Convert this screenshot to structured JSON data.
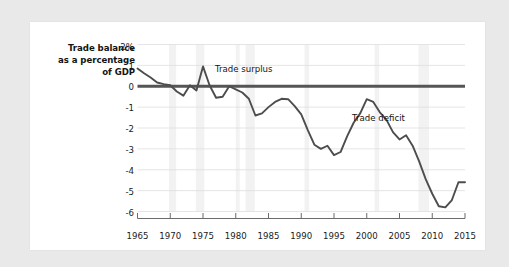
{
  "figure": {
    "background_color": "#e9e9e9",
    "card_color": "#ffffff"
  },
  "chart_data": {
    "type": "line",
    "title": "",
    "subtitle": "",
    "xlabel": "",
    "ylabel": "Trade balance as a percentage of GDP",
    "ylabel_lines": [
      "Trade balance",
      "as a percentage",
      "of GDP"
    ],
    "grid": true,
    "legend_position": "none",
    "xlim": [
      1965,
      2015
    ],
    "ylim": [
      -6,
      2
    ],
    "xticks": [
      1965,
      1970,
      1975,
      1980,
      1985,
      1990,
      1995,
      2000,
      2005,
      2010,
      2015
    ],
    "xtick_labels": [
      "1965",
      "1970",
      "1975",
      "1980",
      "1985",
      "1990",
      "1995",
      "2000",
      "2005",
      "2010",
      "2015"
    ],
    "yticks": [
      2,
      1,
      0,
      -1,
      -2,
      -3,
      -4,
      -5,
      -6
    ],
    "ytick_labels": [
      "2%",
      "1",
      "0",
      "-1",
      "-2",
      "-3",
      "-4",
      "-5",
      "-6"
    ],
    "series_name": "Trade balance as a percentage of GDP",
    "line_color": "#4d4d4d",
    "line_width": 1.9,
    "zero_line_color": "#555555",
    "zero_line_width": 3.0,
    "recession_band_color": "#f2f2f2",
    "grid_color": "#dedede",
    "x": [
      1965,
      1966,
      1967,
      1968,
      1969,
      1970,
      1971,
      1972,
      1973,
      1974,
      1975,
      1976,
      1977,
      1978,
      1979,
      1980,
      1981,
      1982,
      1983,
      1984,
      1985,
      1986,
      1987,
      1988,
      1989,
      1990,
      1991,
      1992,
      1993,
      1994,
      1995,
      1996,
      1997,
      1998,
      1999,
      2000,
      2001,
      2002,
      2003,
      2004,
      2005,
      2006,
      2007,
      2008,
      2009,
      2010,
      2011,
      2012,
      2013,
      2014,
      2015
    ],
    "y": [
      0.85,
      0.62,
      0.42,
      0.18,
      0.1,
      0.05,
      -0.25,
      -0.45,
      0.05,
      -0.2,
      0.95,
      0.05,
      -0.55,
      -0.5,
      0.0,
      -0.15,
      -0.3,
      -0.6,
      -1.4,
      -1.3,
      -1.0,
      -0.75,
      -0.6,
      -0.62,
      -0.95,
      -1.35,
      -2.1,
      -2.8,
      -3.0,
      -2.85,
      -3.3,
      -3.15,
      -2.4,
      -1.75,
      -1.3,
      -0.62,
      -0.75,
      -1.25,
      -1.6,
      -2.2,
      -2.55,
      -2.35,
      -2.85,
      -3.6,
      -4.45,
      -5.15,
      -5.75,
      -5.8,
      -5.45,
      -4.6,
      -4.6
    ],
    "y_detail_note": "values read from gridlines; curve oscillates near 0 until late 1970s, then deepening deficit to about -5.8 near 2006, sharp recovery after 2008 to about -2.7 and settling near -2.9",
    "annotations": [
      {
        "text": "Trade surplus",
        "x_px": 215,
        "y_px": 69
      },
      {
        "text": "Trade deficit",
        "x_px": 352,
        "y_px": 118
      }
    ],
    "recession_bands": [
      {
        "start": 1969.8,
        "end": 1970.9
      },
      {
        "start": 1973.9,
        "end": 1975.2
      },
      {
        "start": 1980.0,
        "end": 1980.6
      },
      {
        "start": 1981.5,
        "end": 1982.9
      },
      {
        "start": 1990.5,
        "end": 1991.2
      },
      {
        "start": 2001.2,
        "end": 2001.9
      },
      {
        "start": 2007.9,
        "end": 2009.5
      }
    ]
  }
}
